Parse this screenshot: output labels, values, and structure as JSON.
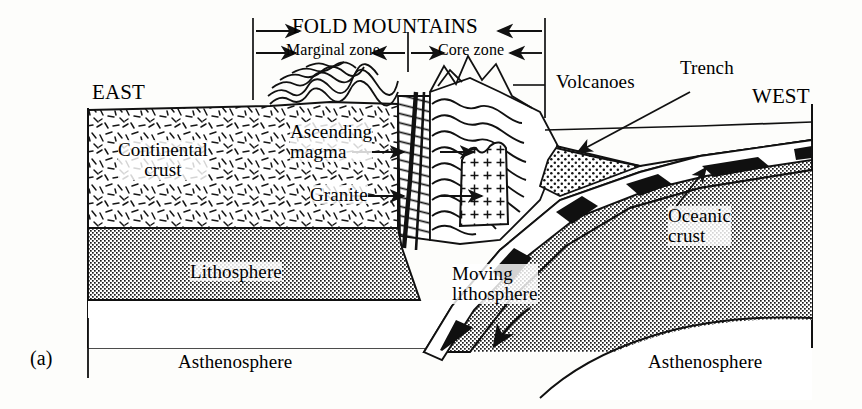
{
  "figure": {
    "panel_label": "(a)",
    "type": "geological cross-section",
    "style": {
      "ink": "#111111",
      "paper": "#fdfdfb",
      "stipple_gray": "#8d8d8d",
      "stripe_black": "#101010"
    }
  },
  "brackets": {
    "fold_mountains": "FOLD MOUNTAINS",
    "marginal_zone": "Marginal zone",
    "core_zone": "Core zone"
  },
  "compass": {
    "east": "EAST",
    "west": "WEST"
  },
  "labels": {
    "continental_crust": "Continental\ncrust",
    "ascending_magma": "Ascending\nmagma",
    "granite": "Granite",
    "volcanoes": "Volcanoes",
    "trench": "Trench",
    "oceanic_crust": "Oceanic\ncrust",
    "lithosphere": "Lithosphere",
    "moving_lithosphere": "Moving\nlithosphere",
    "asthenosphere_left": "Asthenosphere",
    "asthenosphere_right": "Asthenosphere"
  },
  "annotations": {
    "trench_arrow": "arrow pointing down-left to trench",
    "oceanic_crust_arrow": "arrow pointing up-right to magnetic stripe band",
    "magma_arrow": "arrow pointing right into fault conduit",
    "granite_arrow": "arrow pointing right into granite pluton",
    "moving_arrow": "curved arrow pointing down-left along subducting slab"
  },
  "patterns": {
    "continental_crust": "random dash hatch",
    "lithosphere": "fine dot stipple",
    "granite": "plus-sign hatch",
    "folds": "wavy fold layers",
    "marginal_zone": "inclined line hatch",
    "oceanic_crust": "alternating black and white magnetic stripes",
    "trench_sediment": "coarse dot stipple",
    "asthenosphere": "blank white"
  }
}
